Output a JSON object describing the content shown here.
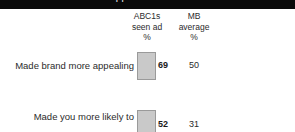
{
  "header_bar": {
    "text": "cropped title banner"
  },
  "chart_data": {
    "type": "bar",
    "title": "",
    "xlabel": "",
    "ylabel": "",
    "grid": false,
    "legend": "none",
    "columns": [
      {
        "id": "abc1s",
        "lines": [
          "ABC1s",
          "seen ad",
          "%"
        ]
      },
      {
        "id": "mb",
        "lines": [
          "MB",
          "average",
          "%"
        ]
      }
    ],
    "categories": [
      "Made brand more appealing",
      "Made you more likely to"
    ],
    "category_lines": [
      [
        "Made brand more appealing"
      ],
      [
        "Made you more likely to"
      ]
    ],
    "series": [
      {
        "name": "ABC1s seen ad %",
        "values": [
          69,
          52
        ]
      },
      {
        "name": "MB average %",
        "values": [
          50,
          31
        ]
      }
    ],
    "value_labels": [
      "69",
      "52"
    ],
    "average_labels": [
      "50",
      "31"
    ],
    "bar_color": "#c9c9c9",
    "bar_border_color": "#9a9a9a",
    "ylim": [
      0,
      100
    ]
  }
}
